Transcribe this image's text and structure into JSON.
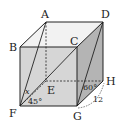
{
  "diagram": {
    "type": "cube",
    "vertices": {
      "A": {
        "label": "A",
        "x": 46,
        "y": 22
      },
      "B": {
        "label": "B",
        "x": 20,
        "y": 47
      },
      "C": {
        "label": "C",
        "x": 77,
        "y": 47
      },
      "D": {
        "label": "D",
        "x": 103,
        "y": 22
      },
      "E": {
        "label": "E",
        "x": 46,
        "y": 81
      },
      "F": {
        "label": "F",
        "x": 20,
        "y": 106
      },
      "G": {
        "label": "G",
        "x": 77,
        "y": 106
      },
      "H": {
        "label": "H",
        "x": 103,
        "y": 81
      }
    },
    "annotations": {
      "angle_x": "x",
      "angle_45": "45°",
      "angle_60": "60°",
      "length_GH": "12"
    },
    "colors": {
      "front_face": "#d6d6d6",
      "right_face": "#b4b4b4",
      "top_face": "#f2f2f2",
      "stroke": "#222222"
    }
  }
}
